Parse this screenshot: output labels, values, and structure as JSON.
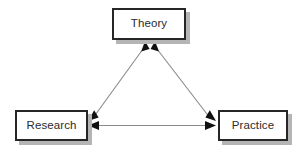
{
  "diagram": {
    "background_color": "#ffffff",
    "line_color": "#8a8a8a",
    "arrowhead_color": "#111111",
    "box_border_color": "#262626",
    "box_fill_color": "#ffffff",
    "box_shadow_color": "#b5b5b5",
    "label_color": "#2b2b2b",
    "nodes": [
      {
        "id": "theory",
        "label": "Theory",
        "x": 112,
        "y": 8,
        "width": 74,
        "height": 32
      },
      {
        "id": "research",
        "label": "Research",
        "x": 15,
        "y": 110,
        "width": 73,
        "height": 31
      },
      {
        "id": "practice",
        "label": "Practice",
        "x": 218,
        "y": 110,
        "width": 70,
        "height": 31
      }
    ],
    "edges": [
      {
        "id": "research-theory",
        "from": "research",
        "to": "theory",
        "direction": "bidirectional",
        "style": "diagonal"
      },
      {
        "id": "theory-practice",
        "from": "theory",
        "to": "practice",
        "direction": "bidirectional",
        "style": "diagonal"
      },
      {
        "id": "research-practice",
        "from": "research",
        "to": "practice",
        "direction": "bidirectional",
        "style": "horizontal"
      }
    ]
  }
}
